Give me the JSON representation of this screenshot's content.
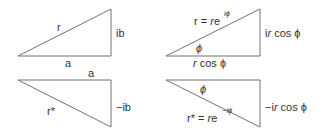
{
  "diagram": {
    "line_color": "#707070",
    "text_color": "#333333",
    "panels": [
      {
        "id": "z-cartesian",
        "hypotenuse_label": "r",
        "vertical_label": "ib",
        "horizontal_label": "a"
      },
      {
        "id": "z-polar",
        "hypotenuse_label_left": "r = ",
        "hypotenuse_label_r": "r",
        "hypotenuse_label_e": "e",
        "hypotenuse_label_exp": "iϕ",
        "angle_label": "ϕ",
        "vertical_label_pre": "i",
        "vertical_label_r": "r",
        "vertical_label_post": " cos ϕ",
        "horizontal_label_r": "r",
        "horizontal_label_post": " cos ϕ"
      },
      {
        "id": "z-conjugate-cartesian",
        "hypotenuse_label": "r*",
        "vertical_label": "−ib",
        "horizontal_label": "a"
      },
      {
        "id": "z-conjugate-polar",
        "hypotenuse_label_left": "r* = ",
        "hypotenuse_label_r": "r",
        "hypotenuse_label_e": "e",
        "hypotenuse_label_exp": "−iϕ",
        "angle_label": "ϕ",
        "vertical_label_pre": "−i",
        "vertical_label_r": "r",
        "vertical_label_post": " cos ϕ"
      }
    ]
  }
}
